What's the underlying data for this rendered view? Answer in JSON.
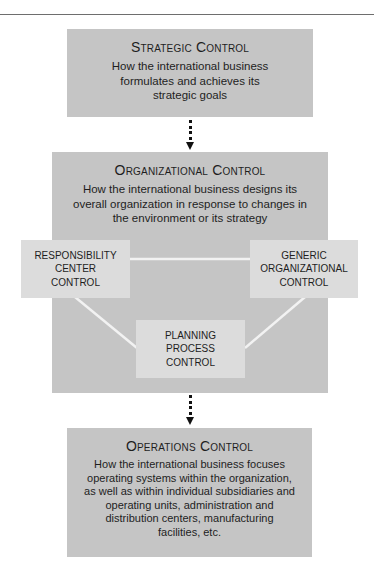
{
  "diagram": {
    "strategic": {
      "title": "Strategic Control",
      "description": "How the international business formulates and achieves its strategic goals"
    },
    "organizational": {
      "title": "Organizational Control",
      "description": "How the international business designs its overall organization in response to changes in the environment or its strategy",
      "components": [
        {
          "label": "RESPONSIBILITY\nCENTER\nCONTROL"
        },
        {
          "label": "GENERIC\nORGANIZATIONAL\nCONTROL"
        },
        {
          "label": "PLANNING\nPROCESS\nCONTROL"
        }
      ]
    },
    "operations": {
      "title": "Operations Control",
      "description": "How the international business focuses operating systems within the organization, as well as within individual subsidiaries and operating units, administration and distribution centers, manufacturing facilities, etc."
    },
    "connectors": [
      "dotted-arrow",
      "dotted-arrow"
    ],
    "colors": {
      "outer_box": "#c5c5c5",
      "inner_box": "#dcdcdc",
      "links": "#f2f2f2",
      "arrow": "#111111"
    }
  }
}
